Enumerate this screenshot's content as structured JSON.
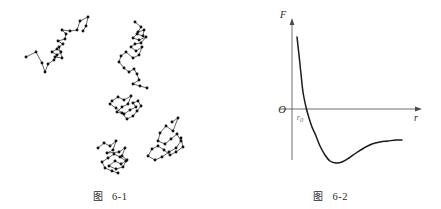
{
  "figures": [
    {
      "id": "figure-6-1",
      "caption_cjk": "图",
      "caption_number": "6-1",
      "description": "Brownian motion random walk traces"
    },
    {
      "id": "figure-6-2",
      "caption_cjk": "图",
      "caption_number": "6-2",
      "description": "Intermolecular force versus separation curve"
    }
  ],
  "force_plot": {
    "y_axis_label": "F",
    "x_axis_label": "r",
    "origin_label": "O",
    "equilibrium_label": "r",
    "equilibrium_subscript": "0"
  },
  "chart_data": [
    {
      "type": "scatter",
      "title": "图 6-1",
      "xlabel": "",
      "ylabel": "",
      "series": [
        {
          "name": "trace-1",
          "points": [
            [
              26,
              57
            ],
            [
              36,
              52
            ],
            [
              42,
              63
            ],
            [
              45,
              72
            ],
            [
              48,
              64
            ],
            [
              54,
              60
            ],
            [
              57,
              55
            ],
            [
              52,
              52
            ],
            [
              57,
              49
            ],
            [
              61,
              52
            ],
            [
              55,
              57
            ],
            [
              62,
              58
            ],
            [
              59,
              47
            ],
            [
              63,
              44
            ],
            [
              58,
              41
            ],
            [
              65,
              39
            ],
            [
              66,
              34
            ],
            [
              62,
              30
            ],
            [
              70,
              31
            ],
            [
              77,
              30
            ],
            [
              80,
              21
            ],
            [
              88,
              17
            ],
            [
              86,
              26
            ],
            [
              83,
              31
            ]
          ]
        },
        {
          "name": "trace-2",
          "points": [
            [
              135,
              22
            ],
            [
              141,
              27
            ],
            [
              138,
              32
            ],
            [
              144,
              30
            ],
            [
              143,
              36
            ],
            [
              137,
              34
            ],
            [
              133,
              38
            ],
            [
              139,
              40
            ],
            [
              146,
              37
            ],
            [
              141,
              43
            ],
            [
              135,
              44
            ],
            [
              131,
              47
            ],
            [
              136,
              51
            ],
            [
              142,
              47
            ],
            [
              139,
              55
            ],
            [
              133,
              58
            ],
            [
              126,
              52
            ],
            [
              121,
              56
            ],
            [
              119,
              62
            ],
            [
              124,
              68
            ],
            [
              129,
              72
            ],
            [
              134,
              69
            ],
            [
              137,
              74
            ],
            [
              139,
              80
            ],
            [
              133,
              84
            ],
            [
              140,
              86
            ],
            [
              147,
              88
            ]
          ]
        },
        {
          "name": "trace-3",
          "points": [
            [
              112,
              101
            ],
            [
              118,
              97
            ],
            [
              124,
              100
            ],
            [
              131,
              96
            ],
            [
              128,
              104
            ],
            [
              122,
              107
            ],
            [
              117,
              112
            ],
            [
              124,
              114
            ],
            [
              130,
              110
            ],
            [
              136,
              107
            ],
            [
              133,
              103
            ],
            [
              138,
              101
            ],
            [
              141,
              106
            ],
            [
              137,
              111
            ],
            [
              133,
              116
            ],
            [
              127,
              119
            ],
            [
              122,
              113
            ],
            [
              116,
              108
            ],
            [
              110,
              104
            ]
          ]
        },
        {
          "name": "trace-4",
          "points": [
            [
              98,
              148
            ],
            [
              104,
              143
            ],
            [
              110,
              146
            ],
            [
              116,
              141
            ],
            [
              113,
              150
            ],
            [
              107,
              153
            ],
            [
              119,
              152
            ],
            [
              125,
              148
            ],
            [
              122,
              156
            ],
            [
              127,
              160
            ],
            [
              121,
              164
            ],
            [
              115,
              161
            ],
            [
              109,
              166
            ],
            [
              116,
              169
            ],
            [
              123,
              167
            ],
            [
              126,
              161
            ],
            [
              120,
              157
            ],
            [
              114,
              154
            ],
            [
              108,
              158
            ],
            [
              102,
              162
            ],
            [
              105,
              168
            ],
            [
              112,
              171
            ],
            [
              118,
              173
            ]
          ]
        },
        {
          "name": "trace-5",
          "points": [
            [
              172,
              122
            ],
            [
              178,
              118
            ],
            [
              173,
              131
            ],
            [
              166,
              126
            ],
            [
              160,
              133
            ],
            [
              158,
              141
            ],
            [
              165,
              144
            ],
            [
              171,
              139
            ],
            [
              177,
              134
            ],
            [
              181,
              141
            ],
            [
              176,
              148
            ],
            [
              169,
              152
            ],
            [
              162,
              157
            ],
            [
              155,
              160
            ],
            [
              148,
              156
            ],
            [
              152,
              149
            ],
            [
              158,
              146
            ],
            [
              164,
              150
            ],
            [
              170,
              155
            ],
            [
              176,
              152
            ],
            [
              183,
              147
            ],
            [
              181,
              138
            ]
          ]
        }
      ]
    },
    {
      "type": "line",
      "title": "图 6-2",
      "xlabel": "r",
      "ylabel": "F",
      "grid": false,
      "legend": "none",
      "annotations": [
        "O",
        "r0"
      ],
      "note": "Repulsive branch positive near small r, crosses zero at r0, minimum (max attraction) then asymptotic to zero",
      "x": [
        297,
        299,
        301,
        303,
        306,
        309,
        312,
        316,
        320,
        325,
        330,
        336,
        342,
        349,
        356,
        364,
        372,
        380,
        388,
        396,
        402
      ],
      "y": [
        37,
        55,
        74,
        92,
        107,
        118,
        127,
        136,
        146,
        155,
        161,
        163,
        162,
        158,
        153,
        148,
        144,
        142,
        141,
        140,
        140
      ]
    }
  ]
}
